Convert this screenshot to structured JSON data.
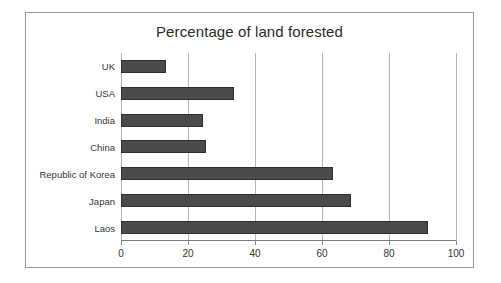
{
  "figure": {
    "title": "Percentage of land forested",
    "frame_color": "#9a9a9a",
    "background": "#ffffff"
  },
  "chart_data": {
    "type": "bar",
    "orientation": "horizontal",
    "title": "Percentage of land forested",
    "xlabel": "",
    "ylabel": "",
    "categories": [
      "UK",
      "USA",
      "India",
      "China",
      "Republic of Korea",
      "Japan",
      "Laos"
    ],
    "values": [
      13.4,
      33.7,
      24.5,
      25.4,
      63.2,
      68.6,
      91.6
    ],
    "xlim": [
      0,
      100
    ],
    "xticks": [
      0,
      20,
      40,
      60,
      80,
      100
    ],
    "xtick_labels": [
      "0",
      "20",
      "40",
      "60",
      "80",
      "100"
    ],
    "grid": true,
    "grid_axis": "x",
    "legend": false,
    "bar_color": "#4a4a4a",
    "bar_edge_color": "#303030",
    "gridline_color": "#b6b6b6"
  }
}
